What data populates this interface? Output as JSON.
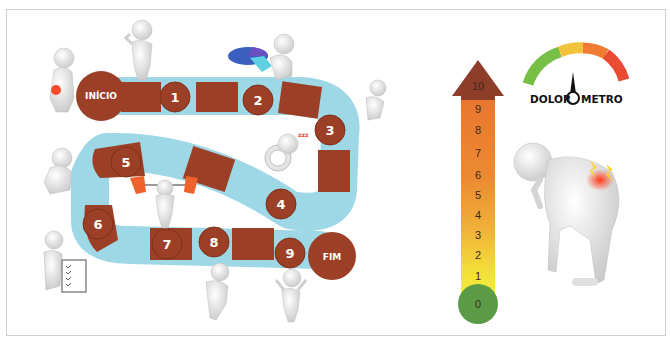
{
  "board": {
    "start_label": "INÍCIO",
    "end_label": "FIM",
    "steps": [
      "1",
      "2",
      "3",
      "4",
      "5",
      "6",
      "7",
      "8",
      "9"
    ],
    "colors": {
      "tile": "#9b3f26",
      "track": "#9ed8e6",
      "start_end": "#9b3f26"
    }
  },
  "scale": {
    "values": [
      "10",
      "9",
      "8",
      "7",
      "6",
      "5",
      "4",
      "3",
      "2",
      "1",
      "0"
    ],
    "colors": {
      "top": "#8e3d28",
      "high": "#e8762e",
      "mid": "#f0b23a",
      "low": "#f3ea38",
      "zero": "#5b9a46"
    }
  },
  "gauge": {
    "title_left": "DOLOR",
    "title_right": "METRO",
    "segments": [
      "#78bf45",
      "#f2c23a",
      "#f07c34",
      "#ea4b32"
    ]
  },
  "figures": [
    "figure-back-pain",
    "figure-thinking",
    "figure-pie-chart",
    "figure-running",
    "figure-sleeping-clock",
    "figure-sad-sitting",
    "figure-weightlifting",
    "figure-checklist",
    "figure-dancing",
    "figure-jumping",
    "figure-bent-back-pain"
  ]
}
